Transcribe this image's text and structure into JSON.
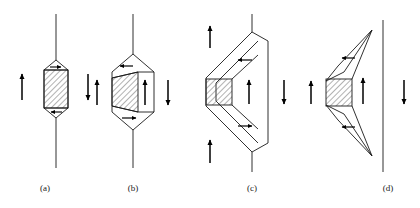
{
  "figure": {
    "background_color": "#ffffff",
    "line_color": "#1a1a1a",
    "hatch_color": "#4d4d4d",
    "arrow_color": "#000000",
    "panel_count": 4
  },
  "panels": [
    {
      "id": "a",
      "caption": "(a)",
      "description": "Straight vertical line with small hatched hexagonal loop centered on it",
      "shape": "hexagon-loop",
      "hatched_region": "hexagon-core",
      "vertical_line": true,
      "arrows": [
        {
          "name": "left-up-arrow",
          "direction": "up",
          "label": "up"
        },
        {
          "name": "right-down-arrow",
          "direction": "down",
          "label": "down"
        },
        {
          "name": "top-inner-right-arrow",
          "direction": "right",
          "label": "right"
        },
        {
          "name": "bottom-inner-left-arrow",
          "direction": "left",
          "label": "left"
        }
      ]
    },
    {
      "id": "b",
      "caption": "(b)",
      "description": "Vertical line with expanded hexagonal loop and hatched parallelogram core",
      "shape": "hexagon-loop-expanded",
      "hatched_region": "parallelogram-core",
      "vertical_line": true,
      "arrows": [
        {
          "name": "left-up-arrow",
          "direction": "up",
          "label": "up"
        },
        {
          "name": "right-down-arrow",
          "direction": "down",
          "label": "down"
        },
        {
          "name": "center-up-arrow",
          "direction": "up",
          "label": "up"
        },
        {
          "name": "upper-segment-left-arrow",
          "direction": "left",
          "label": "left"
        },
        {
          "name": "lower-segment-right-arrow",
          "direction": "right",
          "label": "right"
        }
      ]
    },
    {
      "id": "c",
      "caption": "(c)",
      "description": "Large chevron-shaped expanded loop with hatched square at left apex and straight right edge",
      "shape": "chevron-wide",
      "hatched_region": "square-apex",
      "vertical_line": true,
      "arrows": [
        {
          "name": "outer-left-up-arrow",
          "direction": "up",
          "label": "up"
        },
        {
          "name": "lower-left-up-arrow",
          "direction": "up",
          "label": "up"
        },
        {
          "name": "center-up-arrow",
          "direction": "up",
          "label": "up"
        },
        {
          "name": "right-down-arrow",
          "direction": "down",
          "label": "down"
        },
        {
          "name": "upper-segment-left-arrow",
          "direction": "left",
          "label": "left"
        },
        {
          "name": "lower-segment-right-arrow",
          "direction": "right",
          "label": "right"
        }
      ]
    },
    {
      "id": "d",
      "caption": "(d)",
      "description": "Detached cusp-shaped loop with hatched square, plus separate straight vertical line at right",
      "shape": "cusp-detached",
      "hatched_region": "square-apex",
      "vertical_line": true,
      "arrows": [
        {
          "name": "far-left-up-arrow",
          "direction": "up",
          "label": "up"
        },
        {
          "name": "center-up-arrow",
          "direction": "up",
          "label": "up"
        },
        {
          "name": "right-down-arrow",
          "direction": "down",
          "label": "down"
        },
        {
          "name": "upper-cusp-left-arrow",
          "direction": "left",
          "label": "left"
        },
        {
          "name": "lower-cusp-left-arrow",
          "direction": "left",
          "label": "left"
        }
      ]
    }
  ],
  "captions": {
    "a": "(a)",
    "b": "(b)",
    "c": "(c)",
    "d": "(d)"
  }
}
